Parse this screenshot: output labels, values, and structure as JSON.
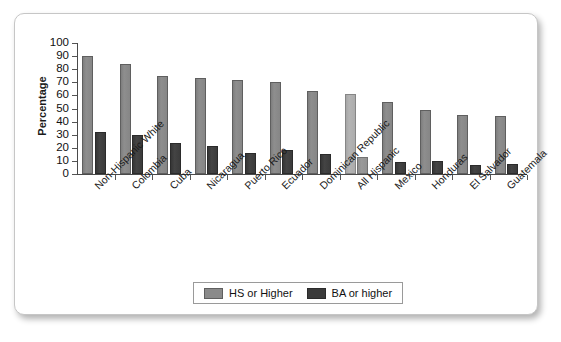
{
  "chart_data": {
    "type": "bar",
    "title": "",
    "xlabel": "",
    "ylabel": "Percentage",
    "ylim": [
      0,
      100
    ],
    "ytick_values": [
      100,
      90,
      80,
      70,
      60,
      50,
      40,
      30,
      20,
      10,
      0
    ],
    "grid": false,
    "legend_position": "bottom-center",
    "categories": [
      "Non-Hispanic White",
      "Colombia",
      "Cuba",
      "Nicaragua",
      "Puerto Rico",
      "Ecuador",
      "Dominican Republic",
      "All Hispanic",
      "Mexico",
      "Honduras",
      "El Salvador",
      "Guatemala"
    ],
    "highlight_category": "All Hispanic",
    "series": [
      {
        "name": "HS or Higher",
        "color": "#8a8a8a",
        "values": [
          90,
          84,
          75,
          73,
          72,
          70,
          63,
          61,
          55,
          49,
          45,
          44
        ]
      },
      {
        "name": "BA or higher",
        "color": "#3b3b3b",
        "values": [
          32,
          30,
          24,
          21,
          16,
          18,
          15,
          13,
          9,
          10,
          7,
          8
        ]
      }
    ]
  },
  "legend": {
    "items": [
      {
        "label": "HS or Higher",
        "swatch": "hs"
      },
      {
        "label": "BA or higher",
        "swatch": "ba"
      }
    ]
  }
}
